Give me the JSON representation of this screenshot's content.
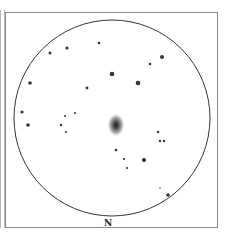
{
  "sketch": {
    "orientation_label": "N",
    "field_circle": {
      "cx": 112,
      "cy": 118,
      "r": 98
    },
    "galaxy": {
      "cx": 116,
      "cy": 125,
      "rx": 9,
      "ry": 12
    },
    "stars": [
      {
        "x": 99,
        "y": 43,
        "r": 1.3
      },
      {
        "x": 67,
        "y": 48,
        "r": 1.6
      },
      {
        "x": 50,
        "y": 53,
        "r": 1.5
      },
      {
        "x": 162,
        "y": 57,
        "r": 2
      },
      {
        "x": 150,
        "y": 64,
        "r": 1.3
      },
      {
        "x": 112,
        "y": 74,
        "r": 2.3
      },
      {
        "x": 138,
        "y": 83,
        "r": 2.3
      },
      {
        "x": 30,
        "y": 83,
        "r": 1.8
      },
      {
        "x": 87,
        "y": 88,
        "r": 1.4
      },
      {
        "x": 22,
        "y": 112,
        "r": 1.6
      },
      {
        "x": 75,
        "y": 113,
        "r": 1.1
      },
      {
        "x": 65,
        "y": 116,
        "r": 1
      },
      {
        "x": 28,
        "y": 125,
        "r": 1.8
      },
      {
        "x": 61,
        "y": 125,
        "r": 1.2
      },
      {
        "x": 66,
        "y": 132,
        "r": 1
      },
      {
        "x": 158,
        "y": 132,
        "r": 1.2
      },
      {
        "x": 160,
        "y": 141,
        "r": 1.2
      },
      {
        "x": 164,
        "y": 141,
        "r": 1.2
      },
      {
        "x": 116,
        "y": 150,
        "r": 1.3
      },
      {
        "x": 124,
        "y": 159,
        "r": 1.1
      },
      {
        "x": 144,
        "y": 160,
        "r": 2.1
      },
      {
        "x": 127,
        "y": 168,
        "r": 1.1
      },
      {
        "x": 160,
        "y": 188,
        "r": 0.8
      },
      {
        "x": 168,
        "y": 195,
        "r": 1.8
      }
    ]
  }
}
